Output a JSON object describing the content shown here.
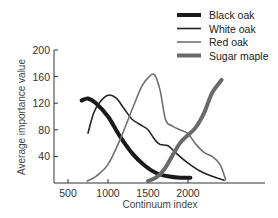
{
  "chart_data": {
    "type": "line",
    "title": "",
    "xlabel": "Continuum index",
    "ylabel": "Average importance value",
    "xlim": [
      350,
      2800
    ],
    "ylim": [
      0,
      200
    ],
    "x_ticks": [
      500,
      1000,
      1500,
      2000
    ],
    "y_ticks": [
      40,
      80,
      120,
      160,
      200
    ],
    "grid": false,
    "legend_position": "top-right",
    "series": [
      {
        "name": "Black oak",
        "color": "#1a1a1a",
        "width": 4,
        "points": [
          [
            670,
            124
          ],
          [
            750,
            127
          ],
          [
            850,
            120
          ],
          [
            1000,
            100
          ],
          [
            1150,
            70
          ],
          [
            1300,
            45
          ],
          [
            1450,
            27
          ],
          [
            1600,
            15
          ],
          [
            1750,
            10
          ],
          [
            1900,
            8
          ],
          [
            2030,
            8
          ]
        ]
      },
      {
        "name": "White oak",
        "color": "#222222",
        "width": 1.6,
        "points": [
          [
            750,
            75
          ],
          [
            820,
            105
          ],
          [
            900,
            122
          ],
          [
            1000,
            132
          ],
          [
            1100,
            128
          ],
          [
            1200,
            112
          ],
          [
            1300,
            96
          ],
          [
            1400,
            88
          ],
          [
            1500,
            80
          ],
          [
            1580,
            66
          ],
          [
            1650,
            58
          ],
          [
            1750,
            56
          ],
          [
            1850,
            45
          ],
          [
            2000,
            30
          ],
          [
            2150,
            18
          ],
          [
            2300,
            10
          ],
          [
            2450,
            4
          ]
        ]
      },
      {
        "name": "Red oak",
        "color": "#707070",
        "width": 1.6,
        "points": [
          [
            740,
            3
          ],
          [
            850,
            10
          ],
          [
            1000,
            28
          ],
          [
            1150,
            65
          ],
          [
            1300,
            110
          ],
          [
            1420,
            145
          ],
          [
            1500,
            158
          ],
          [
            1580,
            163
          ],
          [
            1650,
            140
          ],
          [
            1720,
            95
          ],
          [
            1800,
            86
          ],
          [
            1900,
            80
          ],
          [
            2000,
            74
          ],
          [
            2100,
            58
          ],
          [
            2200,
            46
          ],
          [
            2300,
            40
          ],
          [
            2400,
            28
          ],
          [
            2470,
            5
          ]
        ]
      },
      {
        "name": "Sugar maple",
        "color": "#6a6a6a",
        "width": 4,
        "points": [
          [
            1500,
            3
          ],
          [
            1600,
            8
          ],
          [
            1700,
            20
          ],
          [
            1800,
            40
          ],
          [
            1900,
            60
          ],
          [
            2000,
            72
          ],
          [
            2100,
            84
          ],
          [
            2200,
            105
          ],
          [
            2300,
            135
          ],
          [
            2420,
            155
          ]
        ]
      }
    ]
  }
}
